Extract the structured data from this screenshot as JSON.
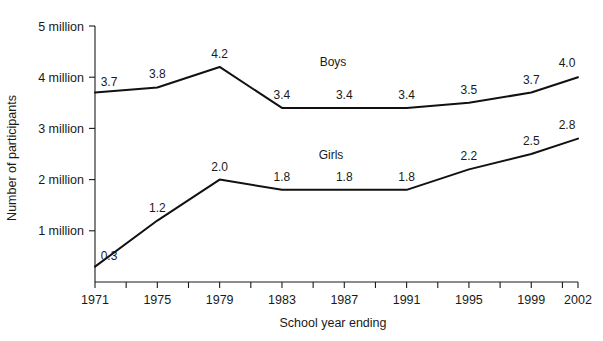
{
  "chart_data": {
    "type": "line",
    "title": "",
    "xlabel": "School year ending",
    "ylabel": "Number of participants",
    "categories": [
      "1971",
      "1975",
      "1979",
      "1983",
      "1987",
      "1991",
      "1995",
      "1999",
      "2002"
    ],
    "x": [
      1971,
      1975,
      1979,
      1983,
      1987,
      1991,
      1995,
      1999,
      2002
    ],
    "xlim": [
      1971,
      2002
    ],
    "ylim": [
      0,
      5
    ],
    "yticks": [
      1,
      2,
      3,
      4,
      5
    ],
    "ytick_labels": [
      "1 million",
      "2 million",
      "3 million",
      "4 million",
      "5 million"
    ],
    "xtick_labels": [
      "1971",
      "1975",
      "1979",
      "1983",
      "1987",
      "1991",
      "1995",
      "1999",
      "2002"
    ],
    "x_minor_ticks": [
      1973,
      1977,
      1981,
      1985,
      1989,
      1993,
      1997,
      2001
    ],
    "grid": false,
    "legend_position": "inline-annotation",
    "units": "millions of participants",
    "series": [
      {
        "name": "Boys",
        "values": [
          3.7,
          3.8,
          4.2,
          3.4,
          3.4,
          3.4,
          3.5,
          3.7,
          4.0
        ],
        "data_labels": [
          "3.7",
          "3.8",
          "4.2",
          "3.4",
          "3.4",
          "3.4",
          "3.5",
          "3.7",
          "4.0"
        ],
        "label_text": "Boys",
        "color": "#111111"
      },
      {
        "name": "Girls",
        "values": [
          0.3,
          1.2,
          2.0,
          1.8,
          1.8,
          1.8,
          2.2,
          2.5,
          2.8
        ],
        "data_labels": [
          "0.3",
          "1.2",
          "2.0",
          "1.8",
          "1.8",
          "1.8",
          "2.2",
          "2.5",
          "2.8"
        ],
        "label_text": "Girls",
        "color": "#111111"
      }
    ]
  },
  "axes": {
    "y_title": "Number of participants",
    "x_title": "School year ending"
  },
  "colors": {
    "line": "#111111",
    "axis": "#1a1a1a",
    "background": "#ffffff"
  }
}
